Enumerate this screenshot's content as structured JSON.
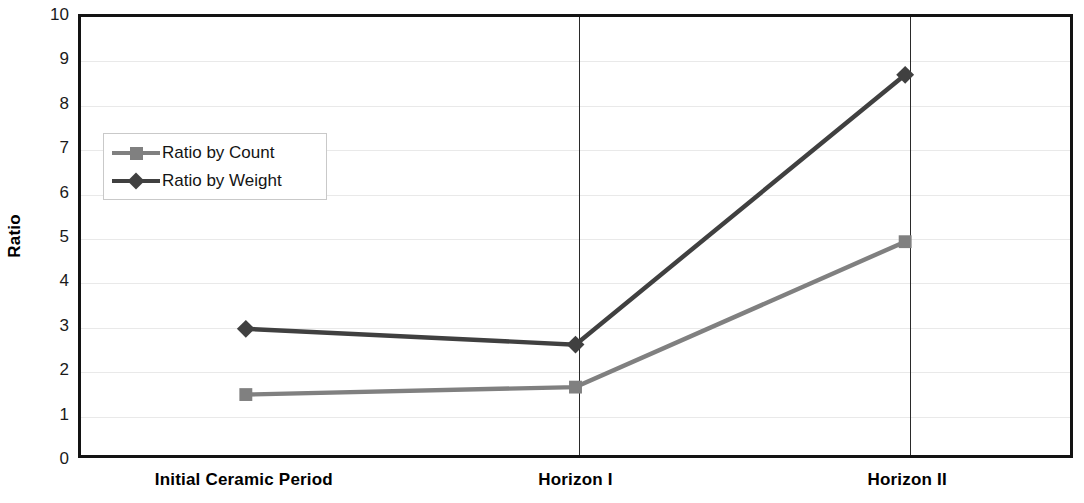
{
  "chart_data": {
    "type": "line",
    "title": "",
    "xlabel": "",
    "ylabel": "Ratio",
    "categories": [
      "Initial Ceramic Period",
      "Horizon I",
      "Horizon II"
    ],
    "ylim": [
      0,
      10
    ],
    "yticks": [
      0,
      1,
      2,
      3,
      4,
      5,
      6,
      7,
      8,
      9,
      10
    ],
    "grid": true,
    "legend_position": "inside-upper-left",
    "series": [
      {
        "name": "Ratio by Count",
        "values": [
          1.38,
          1.55,
          4.87
        ],
        "color": "#808080",
        "marker": "square"
      },
      {
        "name": "Ratio by Weight",
        "values": [
          2.88,
          2.52,
          8.68
        ],
        "color": "#404040",
        "marker": "diamond"
      }
    ],
    "category_separators": [
      1.5,
      2.5
    ]
  },
  "axis": {
    "y_title": "Ratio",
    "tick_labels": [
      "10",
      "9",
      "8",
      "7",
      "6",
      "5",
      "4",
      "3",
      "2",
      "1",
      "0"
    ]
  },
  "legend": {
    "entries": [
      {
        "label": "Ratio by Count"
      },
      {
        "label": "Ratio by Weight"
      }
    ]
  },
  "colors": {
    "count_series": "#808080",
    "weight_series": "#404040",
    "frame": "#131313",
    "gridline": "#e9e9e9",
    "separator": "#2a2a2a"
  }
}
